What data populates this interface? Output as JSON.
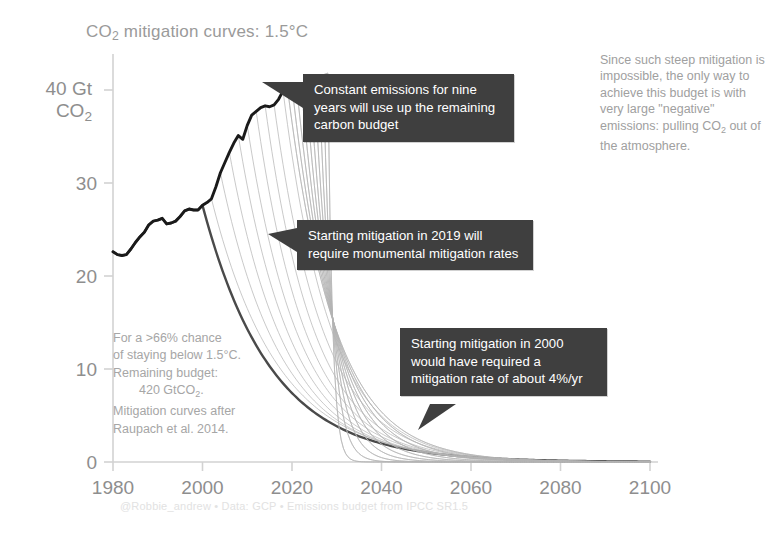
{
  "title": "CO2 mitigation curves: 1.5°C",
  "title_parts": {
    "pre": "CO",
    "sub": "2",
    "post": " mitigation curves: 1.5°C"
  },
  "y_axis": {
    "top_label_line1": "40 Gt",
    "top_label_line2_pre": "CO",
    "top_label_line2_sub": "2",
    "ticks": [
      0,
      10,
      20,
      30,
      40
    ],
    "tick_labels": [
      "0",
      "10",
      "20",
      "30",
      "40"
    ],
    "range": [
      0,
      45
    ]
  },
  "x_axis": {
    "ticks": [
      1980,
      2000,
      2020,
      2040,
      2060,
      2080,
      2100
    ],
    "tick_labels": [
      "1980",
      "2000",
      "2020",
      "2040",
      "2060",
      "2080",
      "2100"
    ],
    "range": [
      1980,
      2100
    ]
  },
  "callouts": [
    {
      "id": "constant-emissions",
      "text": "Constant emissions for nine years will use up the remaining carbon budget"
    },
    {
      "id": "mitigation-2019",
      "text": "Starting mitigation in 2019 will require monumental mitigation rates"
    },
    {
      "id": "mitigation-2000",
      "text": "Starting mitigation in 2000 would have required a mitigation rate of about 4%/yr"
    }
  ],
  "side_note": "Since such steep mitigation is impossible, the only way to achieve this budget is with very large \"negative\" emissions: pulling CO2 out of the atmosphere.",
  "side_note_parts": {
    "before": "Since such steep mitigation is impossible, the only way to achieve this budget is with very large \"negative\" emissions: pulling CO",
    "sub": "2",
    "after": " out of the atmosphere."
  },
  "budget_note": {
    "line1": "For a >66% chance",
    "line2": "of staying below 1.5°C.",
    "line3": "Remaining budget:",
    "line4_pre": "420 GtCO",
    "line4_sub": "2",
    "line4_post": ".",
    "line5": "Mitigation curves after",
    "line6": "Raupach et al. 2014."
  },
  "credit": "@Robbie_andrew  •  Data: GCP  •  Emissions budget from IPCC SR1.5",
  "colors": {
    "historical_line": "#1a1a1a",
    "highlight_curve": "#4a4a4a",
    "fan_curves": "#b4b4b4",
    "axis": "#d2d2d2",
    "callout_bg": "#3f3f3f",
    "callout_text": "#ffffff",
    "text_gray": "#8e8e8e"
  },
  "chart_data": {
    "type": "line",
    "title": "CO2 mitigation curves: 1.5°C",
    "xlabel": "",
    "ylabel": "40 Gt CO2",
    "xlim": [
      1980,
      2100
    ],
    "ylim": [
      0,
      45
    ],
    "grid": false,
    "legend": "none",
    "annotations": [
      "Constant emissions for nine years will use up the remaining carbon budget",
      "Starting mitigation in 2019 will require monumental mitigation rates",
      "Starting mitigation in 2000 would have required a mitigation rate of about 4%/yr",
      "For a >66% chance of staying below 1.5°C. Remaining budget: 420 GtCO2. Mitigation curves after Raupach et al. 2014.",
      "Since such steep mitigation is impossible, the only way to achieve this budget is with very large \"negative\" emissions: pulling CO2 out of the atmosphere."
    ],
    "remaining_budget_GtCO2": 420,
    "budget_probability": ">66%",
    "temperature_target_C": 1.5,
    "constant_emission_years": 9,
    "reference_mitigation_rate_percent_per_year": 4,
    "series": [
      {
        "name": "Historical emissions (GCP)",
        "style": "thick-black",
        "x": [
          1980,
          1981,
          1982,
          1983,
          1984,
          1985,
          1986,
          1987,
          1988,
          1989,
          1990,
          1991,
          1992,
          1993,
          1994,
          1995,
          1996,
          1997,
          1998,
          1999,
          2000,
          2001,
          2002,
          2003,
          2004,
          2005,
          2006,
          2007,
          2008,
          2009,
          2010,
          2011,
          2012,
          2013,
          2014,
          2015,
          2016,
          2017,
          2018,
          2019
        ],
        "values": [
          22.6,
          22.3,
          22.2,
          22.3,
          22.9,
          23.6,
          24.2,
          24.7,
          25.5,
          25.9,
          26.0,
          26.2,
          25.6,
          25.7,
          25.9,
          26.4,
          27.0,
          27.2,
          27.1,
          27.1,
          27.6,
          27.9,
          28.3,
          29.6,
          31.1,
          32.2,
          33.3,
          34.3,
          35.1,
          34.7,
          36.2,
          37.3,
          37.7,
          38.1,
          38.3,
          38.2,
          38.4,
          39.0,
          39.9,
          40.2
        ]
      },
      {
        "name": "Mitigation from 2000 at ~4%/yr (highlighted)",
        "style": "bold-gray",
        "start_year": 2000,
        "peak_value": 27.6,
        "decay_rate_percent": 4
      },
      {
        "name": "Mitigation from 2019 (monumental rates)",
        "style": "thin-gray",
        "start_year": 2019,
        "peak_value": 40.2
      },
      {
        "name": "Constant emissions to 2028 then vertical drop",
        "style": "thin-gray",
        "start_year": 2028,
        "peak_value": 41.8
      }
    ],
    "fan_start_years": [
      2000,
      2002,
      2004,
      2006,
      2008,
      2010,
      2012,
      2014,
      2016,
      2018,
      2019,
      2020,
      2021,
      2022,
      2023,
      2024,
      2025,
      2026,
      2027,
      2028
    ]
  }
}
